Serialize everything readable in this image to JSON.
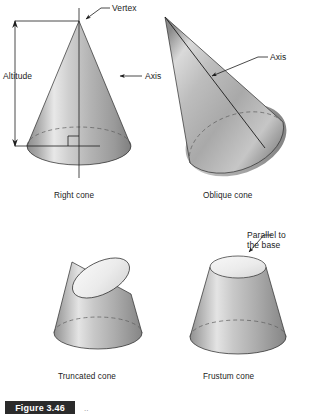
{
  "figure": {
    "caption_label": "Figure 3.46",
    "caption_suffix": "..",
    "background_color": "#ffffff",
    "line_color": "#1c1c1c",
    "solid_light": "#f2f2f2",
    "solid_mid": "#b9b9b9",
    "solid_dark": "#7c7c7c",
    "top_face_color": "#ededed"
  },
  "panels": [
    {
      "id": "right-cone",
      "caption": "Right cone",
      "annotations": [
        {
          "name": "vertex",
          "text": "Vertex"
        },
        {
          "name": "altitude",
          "text": "Altitude"
        },
        {
          "name": "axis",
          "text": "Axis"
        }
      ]
    },
    {
      "id": "oblique-cone",
      "caption": "Oblique cone",
      "annotations": [
        {
          "name": "axis",
          "text": "Axis"
        }
      ]
    },
    {
      "id": "truncated-cone",
      "caption": "Truncated cone",
      "annotations": []
    },
    {
      "id": "frustum-cone",
      "caption": "Frustum cone",
      "annotations": [
        {
          "name": "parallel-to-base",
          "line1": "Parallel to",
          "line2": "the base"
        }
      ]
    }
  ]
}
